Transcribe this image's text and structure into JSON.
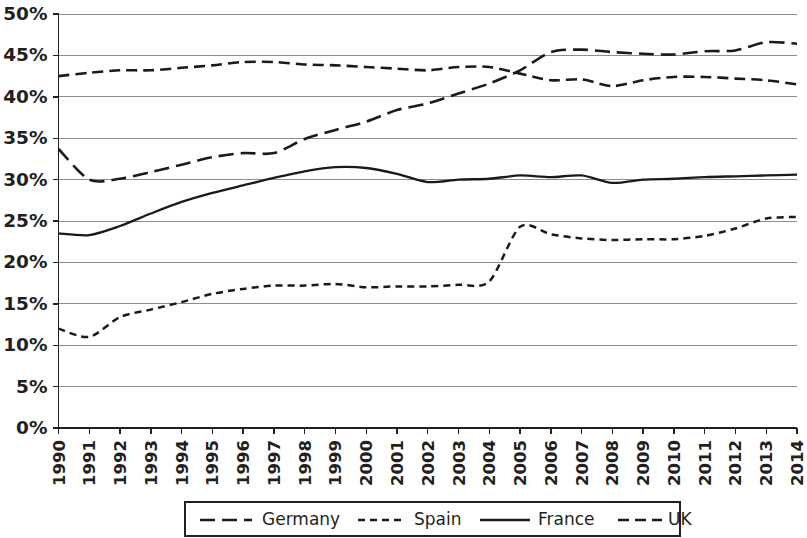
{
  "chart_data": {
    "type": "line",
    "title": "",
    "subtitle": "",
    "xlabel": "",
    "ylabel": "",
    "grid": true,
    "legend_position": "bottom",
    "x": [
      1990,
      1991,
      1992,
      1993,
      1994,
      1995,
      1996,
      1997,
      1998,
      1999,
      2000,
      2001,
      2002,
      2003,
      2004,
      2005,
      2006,
      2007,
      2008,
      2009,
      2010,
      2011,
      2012,
      2013,
      2014
    ],
    "categories": [
      "1990",
      "1991",
      "1992",
      "1993",
      "1994",
      "1995",
      "1996",
      "1997",
      "1998",
      "1999",
      "2000",
      "2001",
      "2002",
      "2003",
      "2004",
      "2005",
      "2006",
      "2007",
      "2008",
      "2009",
      "2010",
      "2011",
      "2012",
      "2013",
      "2014"
    ],
    "ylim": [
      0,
      50
    ],
    "yticks": [
      0,
      5,
      10,
      15,
      20,
      25,
      30,
      35,
      40,
      45,
      50
    ],
    "ytick_labels": [
      "0%",
      "5%",
      "10%",
      "15%",
      "20%",
      "25%",
      "30%",
      "35%",
      "40%",
      "45%",
      "50%"
    ],
    "xlim": [
      1990,
      2014
    ],
    "series": [
      {
        "name": "Germany",
        "dash": "long-dash",
        "color": "#1a1a1a",
        "values": [
          33.7,
          30.0,
          30.1,
          30.9,
          31.8,
          32.7,
          33.2,
          33.2,
          34.9,
          36.0,
          37.0,
          38.4,
          39.2,
          40.4,
          41.6,
          43.2,
          45.4,
          45.7,
          45.4,
          45.2,
          45.1,
          45.5,
          45.6,
          46.6,
          46.4
        ]
      },
      {
        "name": "Spain",
        "dash": "short-dash",
        "color": "#1a1a1a",
        "values": [
          12.0,
          11.0,
          13.4,
          14.3,
          15.2,
          16.2,
          16.8,
          17.2,
          17.2,
          17.4,
          17.0,
          17.1,
          17.1,
          17.3,
          17.7,
          24.3,
          23.4,
          22.9,
          22.7,
          22.8,
          22.8,
          23.2,
          24.1,
          25.3,
          25.5
        ]
      },
      {
        "name": "France",
        "dash": "solid",
        "color": "#1a1a1a",
        "values": [
          23.5,
          23.3,
          24.4,
          25.9,
          27.3,
          28.4,
          29.3,
          30.2,
          31.0,
          31.5,
          31.4,
          30.7,
          29.7,
          30.0,
          30.1,
          30.5,
          30.3,
          30.5,
          29.6,
          30.0,
          30.1,
          30.3,
          30.4,
          30.5,
          30.6
        ]
      },
      {
        "name": "UK",
        "dash": "medium-dash",
        "color": "#1a1a1a",
        "values": [
          42.5,
          42.9,
          43.2,
          43.2,
          43.5,
          43.8,
          44.2,
          44.2,
          43.9,
          43.8,
          43.6,
          43.4,
          43.2,
          43.6,
          43.6,
          42.8,
          42.0,
          42.1,
          41.3,
          42.0,
          42.4,
          42.4,
          42.2,
          42.0,
          41.5
        ]
      }
    ]
  },
  "legend": {
    "items": [
      {
        "label": "Germany",
        "dash": "long-dash"
      },
      {
        "label": "Spain",
        "dash": "short-dash"
      },
      {
        "label": "France",
        "dash": "solid"
      },
      {
        "label": "UK",
        "dash": "medium-dash"
      }
    ]
  }
}
